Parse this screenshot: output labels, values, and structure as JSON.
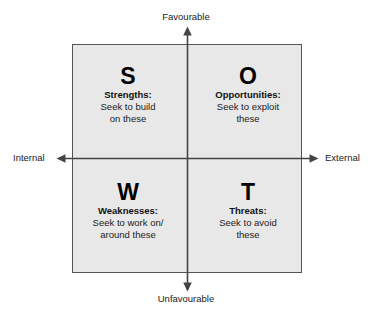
{
  "diagram": {
    "type": "swot-matrix",
    "axes": {
      "top_label": "Favourable",
      "bottom_label": "Unfavourable",
      "left_label": "Internal",
      "right_label": "External",
      "vertical_axis_name": "favourability-axis",
      "horizontal_axis_name": "origin-axis"
    },
    "colors": {
      "box_fill": "#e8e8e8",
      "box_border": "#555555",
      "axis_line": "#444444",
      "text": "#1a1a1a"
    },
    "quadrants": [
      {
        "position": "top-left",
        "letter": "S",
        "heading": "Strengths:",
        "body_line1": "Seek to build",
        "body_line2": "on these"
      },
      {
        "position": "top-right",
        "letter": "O",
        "heading": "Opportunities:",
        "body_line1": "Seek to exploit",
        "body_line2": "these"
      },
      {
        "position": "bottom-left",
        "letter": "W",
        "heading": "Weaknesses:",
        "body_line1": "Seek to work on/",
        "body_line2": "around these"
      },
      {
        "position": "bottom-right",
        "letter": "T",
        "heading": "Threats:",
        "body_line1": "Seek to avoid",
        "body_line2": "these"
      }
    ]
  }
}
